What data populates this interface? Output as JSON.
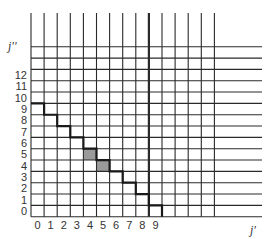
{
  "axes": {
    "x_label": "j'",
    "y_label": "j''",
    "x_ticks": [
      "0",
      "1",
      "2",
      "3",
      "4",
      "5",
      "6",
      "7",
      "8",
      "9"
    ],
    "y_ticks": [
      "0",
      "1",
      "2",
      "3",
      "4",
      "5",
      "6",
      "7",
      "8",
      "9",
      "10",
      "11",
      "12"
    ]
  },
  "grid": {
    "columns": 14,
    "rows": 15,
    "thick_column_line": 9,
    "line_color": "#2a2a2a"
  },
  "staircase": {
    "steps": [
      {
        "col": 0,
        "row_top": 10
      },
      {
        "col": 1,
        "row_top": 9
      },
      {
        "col": 2,
        "row_top": 8
      },
      {
        "col": 3,
        "row_top": 7
      },
      {
        "col": 4,
        "row_top": 6
      },
      {
        "col": 5,
        "row_top": 5
      },
      {
        "col": 6,
        "row_top": 4
      },
      {
        "col": 7,
        "row_top": 3
      },
      {
        "col": 8,
        "row_top": 2
      },
      {
        "col": 9,
        "row_top": 1
      }
    ],
    "color": "#1a1a1a"
  },
  "shaded_cells": [
    {
      "col": 4,
      "row": 5
    },
    {
      "col": 5,
      "row": 4
    }
  ],
  "shade_color": "#9a9a9a"
}
